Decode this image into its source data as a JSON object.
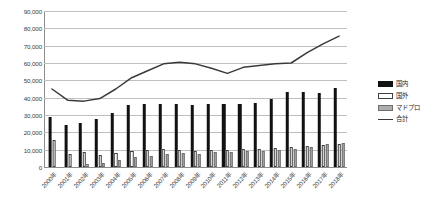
{
  "chart_data": {
    "type": "bar",
    "title": "",
    "xlabel": "",
    "ylabel": "",
    "ylim": [
      0,
      90000
    ],
    "ytick_step": 10000,
    "grid": true,
    "legend_position": "right",
    "categories": [
      "2000年",
      "2001年",
      "2002年",
      "2003年",
      "2004年",
      "2005年",
      "2006年",
      "2007年",
      "2008年",
      "2009年",
      "2010年",
      "2011年",
      "2012年",
      "2013年",
      "2014年",
      "2015年",
      "2016年",
      "2017年",
      "2018年"
    ],
    "ytick_labels": [
      "90,000",
      "80,000",
      "70,000",
      "60,000",
      "50,000",
      "40,000",
      "30,000",
      "20,000",
      "10,000",
      "0"
    ],
    "series": [
      {
        "name": "国内",
        "style": "bar-black",
        "values": [
          29000,
          24500,
          25500,
          27500,
          31000,
          35500,
          36500,
          36500,
          36500,
          35500,
          36500,
          36500,
          36500,
          37000,
          39500,
          43000,
          43000,
          42500,
          45500
        ]
      },
      {
        "name": "国外",
        "style": "bar-white",
        "values": [
          15500,
          7500,
          8500,
          7000,
          8000,
          9500,
          10000,
          10500,
          10000,
          9500,
          10000,
          10000,
          10500,
          10500,
          11000,
          11500,
          12000,
          12500,
          13000
        ]
      },
      {
        "name": "マドプロ",
        "style": "bar-gray",
        "values": [
          0,
          0,
          2000,
          2500,
          4000,
          5500,
          6500,
          7500,
          8000,
          7500,
          8500,
          8500,
          9000,
          9500,
          10000,
          10500,
          11500,
          13000,
          14000
        ]
      },
      {
        "name": "合計",
        "style": "line",
        "values": [
          45000,
          38500,
          38000,
          39500,
          45000,
          51500,
          55500,
          59500,
          60500,
          59500,
          57000,
          54000,
          57500,
          58500,
          59500,
          60000,
          66000,
          71000,
          75500
        ]
      }
    ]
  },
  "legend": {
    "items": [
      {
        "label": "国内",
        "key": "k-domestic",
        "color": "#121212"
      },
      {
        "label": "国外",
        "key": "k-foreign",
        "color": "#ffffff"
      },
      {
        "label": "マドプロ",
        "key": "k-madrid",
        "color": "#adadad"
      },
      {
        "label": "合計",
        "key": "k-total",
        "color": "#3a3a3a"
      }
    ]
  }
}
